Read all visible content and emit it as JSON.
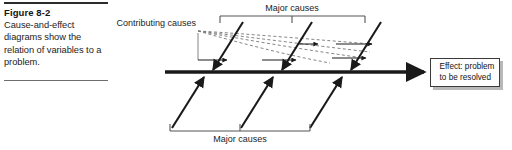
{
  "caption": {
    "title": "Figure 8-2",
    "body": "Cause-and-effect diagrams show the relation of variables to a problem."
  },
  "diagram": {
    "type": "fishbone-cause-and-effect",
    "labels": {
      "contributing_causes": "Contributing causes",
      "major_causes_top": "Major causes",
      "major_causes_bottom": "Major causes",
      "effect": "Effect: problem\nto be resolved"
    },
    "spine": {
      "x1": 165,
      "y1": 72,
      "x2": 430,
      "y2": 72,
      "arrow": "right"
    },
    "upper_bones": [
      {
        "x1": 243,
        "y1": 22,
        "x2": 212,
        "y2": 72
      },
      {
        "x1": 312,
        "y1": 22,
        "x2": 281,
        "y2": 72
      },
      {
        "x1": 381,
        "y1": 22,
        "x2": 350,
        "y2": 72
      }
    ],
    "lower_bones": [
      {
        "x1": 172,
        "y1": 128,
        "x2": 205,
        "y2": 75
      },
      {
        "x1": 241,
        "y1": 128,
        "x2": 274,
        "y2": 75
      },
      {
        "x1": 310,
        "y1": 128,
        "x2": 343,
        "y2": 75
      }
    ],
    "top_bracket": {
      "x1": 220,
      "y1": 16,
      "x2": 365,
      "ticks": [
        220,
        292,
        365
      ],
      "direction": "down"
    },
    "bottom_bracket": {
      "x1": 170,
      "y1": 131,
      "x2": 310,
      "ticks": [
        170,
        240,
        310
      ],
      "direction": "up"
    },
    "contributing_origin": {
      "x": 197,
      "y": 31
    },
    "dashed_branches": 4,
    "feeder_arrows": 5,
    "colors": {
      "line": "#1a1a1a",
      "bracket": "#555555",
      "dashed": "#777777",
      "box_border": "#3a3a3a",
      "box_shadow": "#b8b8b8",
      "text": "#1c1c1c",
      "background": "#ffffff"
    }
  }
}
